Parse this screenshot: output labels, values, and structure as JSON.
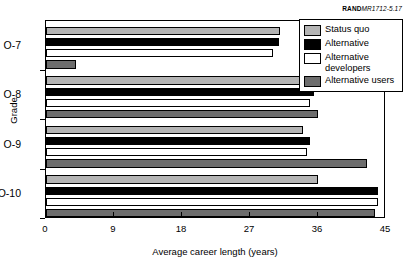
{
  "credit": {
    "brand": "RAND",
    "reference": "MR1712-5.17"
  },
  "chart_data": {
    "type": "bar",
    "orientation": "horizontal",
    "title": "",
    "xlabel": "Average career length (years)",
    "ylabel": "Grade",
    "categories": [
      "O-7",
      "O-8",
      "O-9",
      "O-10"
    ],
    "xlim": [
      0,
      45
    ],
    "xticks": [
      0,
      9,
      18,
      27,
      36,
      45
    ],
    "xtick_labels": [
      "0",
      "9",
      "18",
      "27",
      "36",
      "45"
    ],
    "grid": false,
    "legend_position": "top-right",
    "series": [
      {
        "name": "Status quo",
        "color": "#b4b4b4",
        "values": [
          31,
          35.5,
          34,
          36
        ]
      },
      {
        "name": "Alternative",
        "color": "#000000",
        "values": [
          30.8,
          35.5,
          35,
          44
        ]
      },
      {
        "name": "Alternative developers",
        "color": "#ffffff",
        "values": [
          30,
          35,
          34.5,
          44
        ]
      },
      {
        "name": "Alternative users",
        "color": "#6d6d6d",
        "values": [
          4,
          36,
          42.5,
          43.5
        ]
      }
    ]
  },
  "legend": {
    "items": [
      {
        "label": "Status quo",
        "swatch": "#b4b4b4"
      },
      {
        "label": "Alternative",
        "swatch": "#000000"
      },
      {
        "label": "Alternative developers",
        "swatch": "#ffffff"
      },
      {
        "label": "Alternative users",
        "swatch": "#6d6d6d"
      }
    ]
  }
}
